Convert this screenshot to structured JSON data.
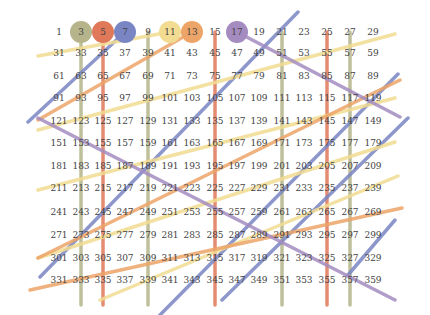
{
  "diagram": {
    "grid": {
      "columns": 15,
      "rows": 12,
      "start": 1,
      "step": 2,
      "col_x": [
        59,
        81,
        103,
        125,
        148,
        170,
        192,
        215,
        237,
        259,
        282,
        304,
        327,
        350,
        373
      ],
      "row_y": [
        32,
        53,
        76,
        98,
        121,
        143,
        166,
        188,
        212,
        235,
        258,
        280
      ]
    },
    "primes_circled": [
      {
        "n": 3,
        "color": "#b5b48a"
      },
      {
        "n": 5,
        "color": "#e0785a"
      },
      {
        "n": 7,
        "color": "#7a86c4"
      },
      {
        "n": 11,
        "color": "#f2dc92"
      },
      {
        "n": 13,
        "color": "#eda468"
      },
      {
        "n": 17,
        "color": "#a48cc0"
      }
    ],
    "colors": {
      "three": "#b5b48a",
      "five": "#e0785a",
      "seven": "#7a86c4",
      "eleven": "#f2dc92",
      "thirteen": "#eda468",
      "seventeen": "#a48cc0",
      "text": "#444444"
    }
  }
}
